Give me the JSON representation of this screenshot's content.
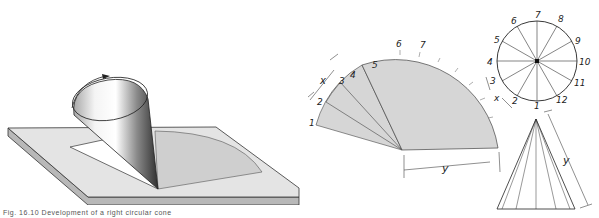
{
  "figure": {
    "caption": "Fig. 16.10   Development of a right circular cone",
    "panels": {
      "pictorial": {
        "description": "Cone rolling on a flat plate to trace its development",
        "rotation_arrow": "curved-arrow"
      },
      "development": {
        "arc_labels": [
          "1",
          "2",
          "3",
          "4",
          "5",
          "6",
          "7"
        ],
        "chord_dimension": "x",
        "radius_dimension": "y"
      },
      "top_view": {
        "division_labels": [
          "1",
          "2",
          "3",
          "4",
          "5",
          "6",
          "7",
          "8",
          "9",
          "10",
          "11",
          "12"
        ],
        "chord_dimension": "x"
      },
      "front_view": {
        "slant_dimension": "y"
      }
    },
    "colors": {
      "line": "#222222",
      "fill_gray": "#d4d4d4",
      "plate_top": "#e4e4e4",
      "plate_edge": "#b8b8b8"
    }
  }
}
